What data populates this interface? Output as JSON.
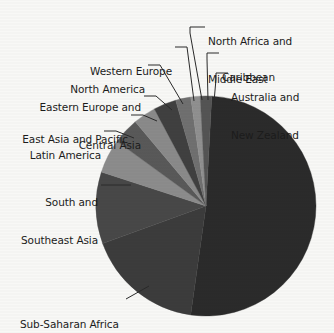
{
  "figure": {
    "background_color": "#f8f8f6",
    "text_color": "#1c1c1c",
    "leader_color": "#2a2a2a"
  },
  "chart_data": {
    "type": "pie",
    "title": "",
    "subtitle": "",
    "xlabel": "",
    "ylabel": "",
    "legend_position": "none",
    "grid": false,
    "label_style": "leader-lines",
    "start_angle_deg": 3,
    "direction": "clockwise",
    "center": {
      "x": 206,
      "y": 206
    },
    "radius": 110,
    "categories": [
      "Sub-Saharan Africa",
      "South and Southeast Asia",
      "Latin America",
      "East Asia and Pacific",
      "Eastern Europe and Central Asia",
      "North America",
      "Western Europe",
      "North Africa and Middle East",
      "Caribbean",
      "Australia and New Zealand"
    ],
    "values": [
      51.4,
      17.2,
      10.6,
      5.0,
      3.9,
      3.3,
      3.3,
      2.2,
      1.4,
      1.7
    ],
    "slices": [
      {
        "label": "Sub-Saharan Africa",
        "label_lines": [
          "Sub-Saharan Africa"
        ],
        "value": 51.4,
        "start_deg": 3,
        "end_deg": 188,
        "color": "#2b2b2b"
      },
      {
        "label": "South and Southeast Asia",
        "label_lines": [
          "South and",
          "Southeast Asia"
        ],
        "value": 17.2,
        "start_deg": 188,
        "end_deg": 250,
        "color": "#3c3c3c"
      },
      {
        "label": "Latin America",
        "label_lines": [
          "Latin America"
        ],
        "value": 10.6,
        "start_deg": 250,
        "end_deg": 288,
        "color": "#484848"
      },
      {
        "label": "East Asia and Pacific",
        "label_lines": [
          "East Asia and Pacific"
        ],
        "value": 5.0,
        "start_deg": 288,
        "end_deg": 306,
        "color": "#8c8c8c"
      },
      {
        "label": "Eastern Europe and Central Asia",
        "label_lines": [
          "Eastern Europe and",
          "Central Asia"
        ],
        "value": 3.9,
        "start_deg": 306,
        "end_deg": 320,
        "color": "#595959"
      },
      {
        "label": "North America",
        "label_lines": [
          "North America"
        ],
        "value": 3.3,
        "start_deg": 320,
        "end_deg": 332,
        "color": "#8a8a8a"
      },
      {
        "label": "Western Europe",
        "label_lines": [
          "Western Europe"
        ],
        "value": 3.3,
        "start_deg": 332,
        "end_deg": 344,
        "color": "#404040"
      },
      {
        "label": "North Africa and Middle East",
        "label_lines": [
          "North Africa and",
          "Middle East"
        ],
        "value": 2.2,
        "start_deg": 344,
        "end_deg": 352,
        "color": "#707070"
      },
      {
        "label": "Caribbean",
        "label_lines": [
          "Caribbean"
        ],
        "value": 1.4,
        "start_deg": 352,
        "end_deg": 357,
        "color": "#909090"
      },
      {
        "label": "Australia and New Zealand",
        "label_lines": [
          "Australia and",
          "New Zealand"
        ],
        "value": 1.7,
        "start_deg": 357,
        "end_deg": 363,
        "color": "#545454"
      }
    ]
  },
  "labels": {
    "north_africa_middle_east": {
      "line1": "North Africa and",
      "line2": "Middle East"
    },
    "caribbean": {
      "line1": "Caribbean"
    },
    "australia_new_zealand": {
      "line1": "Australia and",
      "line2": "New Zealand"
    },
    "western_europe": {
      "line1": "Western Europe"
    },
    "north_america": {
      "line1": "North America"
    },
    "eastern_europe_central_asia": {
      "line1": "Eastern Europe and",
      "line2": "Central Asia"
    },
    "east_asia_pacific": {
      "line1": "East Asia and Pacific"
    },
    "latin_america": {
      "line1": "Latin America"
    },
    "south_southeast_asia": {
      "line1": "South and",
      "line2": "Southeast Asia"
    },
    "sub_saharan_africa": {
      "line1": "Sub-Saharan Africa"
    }
  }
}
